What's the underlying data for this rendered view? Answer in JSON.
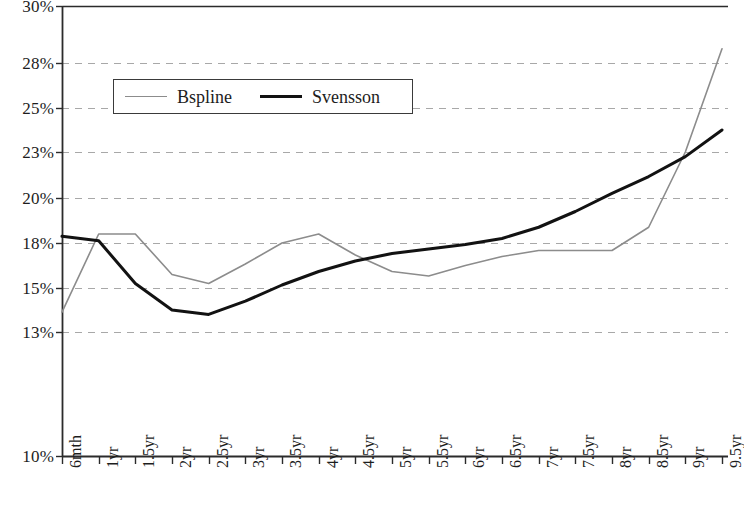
{
  "chart_data": {
    "type": "line",
    "title": "",
    "xlabel": "",
    "ylabel": "",
    "grid": true,
    "legend_position": "top-left",
    "categories": [
      "6mth",
      "1yr",
      "1.5yr",
      "2yr",
      "2.5yr",
      "3yr",
      "3.5yr",
      "4yr",
      "4.5yr",
      "5yr",
      "5.5yr",
      "6yr",
      "6.5yr",
      "7yr",
      "7.5yr",
      "8yr",
      "8.5yr",
      "9yr",
      "9.5yr"
    ],
    "ylim": [
      10,
      30
    ],
    "ytick_labels": [
      "30%",
      "28%",
      "25%",
      "23%",
      "20%",
      "18%",
      "15%",
      "13%",
      "10%"
    ],
    "ytick_values": [
      30,
      28,
      25,
      23,
      20,
      18,
      15,
      13,
      10
    ],
    "series": [
      {
        "name": "Bspline",
        "color": "#8c8c8c",
        "width": 1.6,
        "values": [
          13.9,
          18.4,
          18.4,
          15.9,
          15.3,
          16.6,
          18.0,
          18.4,
          17.2,
          16.1,
          15.8,
          16.5,
          17.1,
          17.5,
          17.5,
          17.5,
          18.7,
          23.0,
          28.5
        ]
      },
      {
        "name": "Svensson",
        "color": "#121212",
        "width": 3,
        "values": [
          18.3,
          18.1,
          15.3,
          14.0,
          13.8,
          14.4,
          15.2,
          16.1,
          16.8,
          17.3,
          17.6,
          17.9,
          18.2,
          18.7,
          19.4,
          20.3,
          21.4,
          22.7,
          24.0
        ]
      }
    ]
  },
  "legend": {
    "entries": [
      {
        "label": "Bspline"
      },
      {
        "label": "Svensson"
      }
    ]
  },
  "axes": {
    "x_tick_labels": [
      "6mth",
      "1yr",
      "1.5yr",
      "2yr",
      "2.5yr",
      "3yr",
      "3.5yr",
      "4yr",
      "4.5yr",
      "5yr",
      "5.5yr",
      "6yr",
      "6.5yr",
      "7yr",
      "7.5yr",
      "8yr",
      "8.5yr",
      "9yr",
      "9.5yr"
    ],
    "y_tick_labels": [
      "30%",
      "28%",
      "25%",
      "23%",
      "20%",
      "18%",
      "15%",
      "13%",
      "10%"
    ]
  }
}
